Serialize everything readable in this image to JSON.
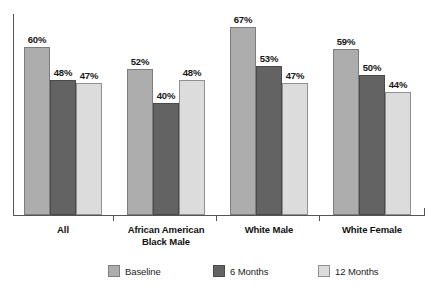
{
  "chart_data": {
    "type": "bar",
    "title": "",
    "subtitle": "",
    "xlabel": "",
    "ylabel": "",
    "ylim": [
      0,
      72
    ],
    "grid": false,
    "legend_position": "bottom-center",
    "value_suffix": "%",
    "categories": [
      "All",
      "African American\nBlack Male",
      "White Male",
      "White Female"
    ],
    "category_lines": [
      [
        "All"
      ],
      [
        "African American",
        "Black Male"
      ],
      [
        "White Male"
      ],
      [
        "White Female"
      ]
    ],
    "series": [
      {
        "name": "Baseline",
        "color": "#adadad",
        "values": [
          60,
          52,
          67,
          59
        ],
        "labels": [
          "60%",
          "52%",
          "67%",
          "59%"
        ]
      },
      {
        "name": "6 Months",
        "color": "#636363",
        "values": [
          48,
          40,
          53,
          50
        ],
        "labels": [
          "48%",
          "40%",
          "53%",
          "50%"
        ]
      },
      {
        "name": "12 Months",
        "color": "#dcdcdc",
        "values": [
          47,
          48,
          47,
          44
        ],
        "labels": [
          "47%",
          "48%",
          "47%",
          "44%"
        ]
      }
    ]
  },
  "legend": {
    "items": [
      {
        "label": "Baseline"
      },
      {
        "label": "6 Months"
      },
      {
        "label": "12 Months"
      }
    ]
  },
  "axes": {
    "x_axis_visible": true,
    "y_axis_visible": true,
    "tick_labels": []
  }
}
